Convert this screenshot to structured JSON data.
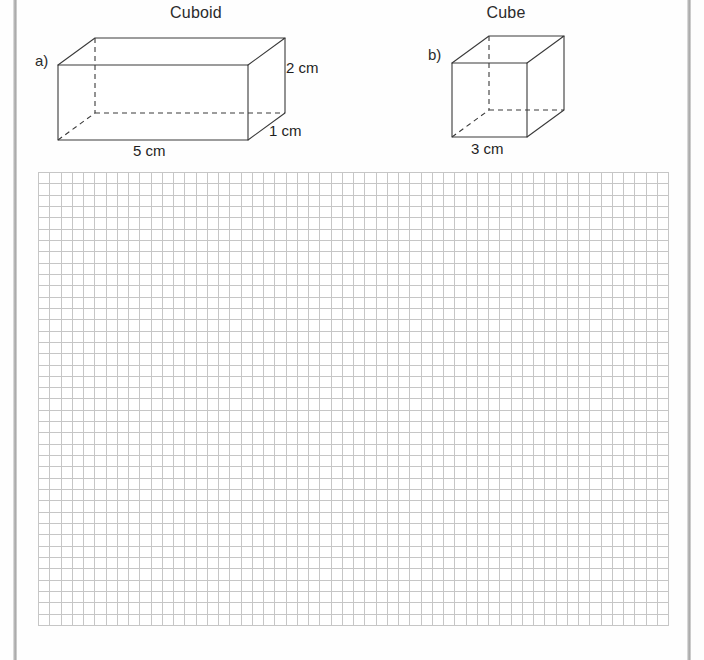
{
  "page": {
    "width": 704,
    "height": 660,
    "background_color": "#fefefe"
  },
  "gutter": {
    "color": "#a8a8a8",
    "left_label": "page-gutter-left",
    "right_label": "page-gutter-right"
  },
  "figures": [
    {
      "id": "cuboid",
      "part_label": "a)",
      "title": "Cuboid",
      "shape": "cuboid",
      "dimensions": [
        {
          "name": "width",
          "value": "5 cm",
          "position": "bottom"
        },
        {
          "name": "height",
          "value": "2 cm",
          "position": "right"
        },
        {
          "name": "depth",
          "value": "1 cm",
          "position": "bottom-right"
        }
      ],
      "geometry": {
        "front_left_x": 58,
        "front_right_x": 248,
        "front_top_y": 65,
        "front_bottom_y": 140,
        "depth_dx": 37,
        "depth_dy": -27
      }
    },
    {
      "id": "cube",
      "part_label": "b)",
      "title": "Cube",
      "shape": "cube",
      "dimensions": [
        {
          "name": "width",
          "value": "3 cm",
          "position": "bottom"
        }
      ],
      "geometry": {
        "front_left_x": 452,
        "front_right_x": 527,
        "front_top_y": 63,
        "front_bottom_y": 137,
        "depth_dx": 37,
        "depth_dy": -27
      }
    }
  ],
  "grid": {
    "name": "squared-working-area",
    "columns": 56,
    "rows": 40,
    "cell_size_px": 11.3,
    "line_color": "#c6c6c6",
    "fill_color": "#ffffff",
    "left": 38,
    "top": 172,
    "width": 630,
    "height": 453
  },
  "style": {
    "edge_color": "#3a3a3a",
    "text_color": "#2b2b2b"
  }
}
